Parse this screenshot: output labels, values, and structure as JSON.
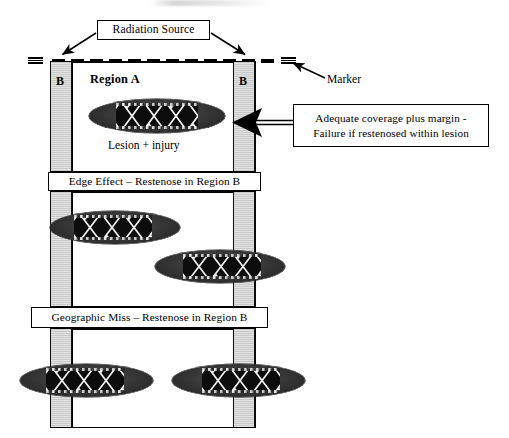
{
  "diagram": {
    "title_callouts": {
      "radiation_source": "Radiation Source",
      "marker": "Marker",
      "coverage": "Adequate coverage plus margin -\nFailure if restenosed within lesion",
      "edge_effect": "Edge Effect – Restenose in Region B",
      "geographic_miss": "Geographic Miss – Restenose in Region B"
    },
    "labels": {
      "region_a": "Region A",
      "region_b_left": "B",
      "region_b_right": "B",
      "lesion_injury": "Lesion + injury"
    },
    "colors": {
      "ink": "#000000",
      "edge_band_fill": "#d6d6d6",
      "plaque_dark": "#333333",
      "stent_black": "#0c0c0c",
      "stent_mesh": "#ffffff",
      "paper": "#ffffff"
    },
    "icons": {
      "marker": "stacked-bars-icon",
      "radiation_line": "dashed-line-icon",
      "pointer_left": "left-arrow-icon",
      "pointer_down_left": "down-left-arrow-icon",
      "pointer_down_right": "down-right-arrow-icon",
      "pointer_up_left": "up-left-arrow-icon"
    },
    "rows": [
      {
        "name": "adequate-coverage-row",
        "caption": "Lesion + injury",
        "lesions": [
          {
            "name": "lesion-centered",
            "placement": "centered within Region A"
          }
        ]
      },
      {
        "name": "edge-effect-row",
        "caption": "Edge Effect – Restenose in Region B",
        "lesions": [
          {
            "name": "lesion-left-overhang",
            "placement": "overlaps left Region B"
          },
          {
            "name": "lesion-right-overhang",
            "placement": "overlaps right Region B"
          }
        ]
      },
      {
        "name": "geographic-miss-row",
        "caption": "Geographic Miss – Restenose in Region B",
        "lesions": [
          {
            "name": "lesion-far-left",
            "placement": "extends left of Region B"
          },
          {
            "name": "lesion-far-right",
            "placement": "extends right of Region B"
          }
        ]
      }
    ]
  }
}
